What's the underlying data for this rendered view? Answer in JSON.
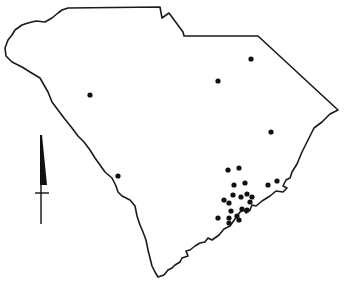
{
  "map": {
    "region": "South Carolina",
    "outline_color": "#1a1a1a",
    "background_color": "#ffffff",
    "outline_path": "M 68,8 L 160,7 L 162,18 L 169,13 L 183,32 L 184,36 L 258,36 L 338,110 L 330,114 L 322,122 L 314,128 L 308,140 L 302,152 L 297,164 L 292,172 L 290,178 L 286,180 L 283,186 L 287,188 L 283,192 L 276,191 L 270,196 L 262,201 L 256,206 L 252,205 L 250,210 L 246,213 L 244,210 L 240,212 L 235,219 L 230,226 L 224,229 L 219,235 L 212,240 L 208,238 L 205,242 L 200,243 L 195,246 L 190,250 L 186,251 L 188,256 L 182,258 L 180,262 L 175,265 L 172,268 L 168,270 L 164,275 L 158,277 L 155,272 L 152,266 L 150,258 L 148,250 L 146,240 L 143,232 L 140,225 L 137,216 L 135,206 L 130,200 L 122,196 L 118,192 L 116,186 L 112,178 L 105,172 L 100,165 L 95,158 L 90,150 L 84,142 L 78,136 L 72,128 L 64,118 L 58,110 L 52,102 L 48,92 L 40,78 L 30,72 L 22,67 L 12,62 L 6,56 L 5,48 L 8,40 L 12,35 L 15,30 L 22,25 L 28,23 L 36,21 L 45,22 L 52,18 L 58,13 L 62,10 L 68,8 Z",
    "points": [
      {
        "x": 90,
        "y": 95
      },
      {
        "x": 218,
        "y": 81
      },
      {
        "x": 251,
        "y": 59
      },
      {
        "x": 271,
        "y": 132
      },
      {
        "x": 118,
        "y": 176
      },
      {
        "x": 228,
        "y": 170
      },
      {
        "x": 239,
        "y": 168
      },
      {
        "x": 234,
        "y": 185
      },
      {
        "x": 245,
        "y": 183
      },
      {
        "x": 233,
        "y": 195
      },
      {
        "x": 241,
        "y": 197
      },
      {
        "x": 247,
        "y": 194
      },
      {
        "x": 252,
        "y": 197
      },
      {
        "x": 224,
        "y": 200
      },
      {
        "x": 229,
        "y": 203
      },
      {
        "x": 250,
        "y": 202
      },
      {
        "x": 242,
        "y": 209
      },
      {
        "x": 247,
        "y": 210
      },
      {
        "x": 231,
        "y": 211
      },
      {
        "x": 237,
        "y": 216
      },
      {
        "x": 218,
        "y": 218
      },
      {
        "x": 229,
        "y": 218
      },
      {
        "x": 239,
        "y": 220
      },
      {
        "x": 229,
        "y": 223
      },
      {
        "x": 268,
        "y": 185
      },
      {
        "x": 277,
        "y": 181
      }
    ],
    "point_radius": 2.6,
    "north_arrow": {
      "icon": "north-arrow-icon",
      "x": 41,
      "top": 135,
      "head_bottom": 185,
      "crossbar_y": 193,
      "bottom": 224
    }
  }
}
